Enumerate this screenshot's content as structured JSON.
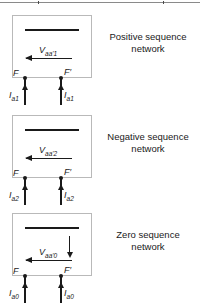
{
  "figure": {
    "blocks": [
      {
        "id": "positive",
        "caption": "Positive sequence network",
        "voltage_symbol": "V",
        "voltage_subscript": "aa'1",
        "terminal_left": "F",
        "terminal_right": "F′",
        "current_symbol": "I",
        "current_subscript": "a1",
        "current_left_label": "I",
        "current_right_label": "I",
        "has_down_arrow": false
      },
      {
        "id": "negative",
        "caption": "Negative sequence network",
        "voltage_symbol": "V",
        "voltage_subscript": "aa'2",
        "terminal_left": "F",
        "terminal_right": "F′",
        "current_symbol": "I",
        "current_subscript": "a2",
        "current_left_label": "I",
        "current_right_label": "I",
        "has_down_arrow": true
      },
      {
        "id": "zero",
        "caption": "Zero sequence network",
        "voltage_symbol": "V",
        "voltage_subscript": "aa'0",
        "terminal_left": "F",
        "terminal_right": "F′",
        "current_symbol": "I",
        "current_subscript": "a0",
        "current_left_label": "I",
        "current_right_label": "I",
        "has_down_arrow": true
      }
    ],
    "colors": {
      "ink": "#1a1a1a",
      "box_border": "#b9b9b9",
      "rule": "#8a8a8a"
    }
  }
}
